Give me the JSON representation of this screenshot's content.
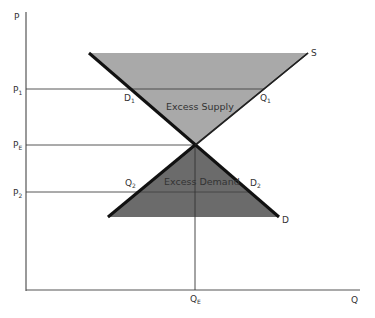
{
  "axes": {
    "y_label": "P",
    "x_label": "Q"
  },
  "price_levels": [
    {
      "id": "p1",
      "label": "P",
      "subscript": "1"
    },
    {
      "id": "pe",
      "label": "P",
      "subscript": "E"
    },
    {
      "id": "p2",
      "label": "P",
      "subscript": "2"
    }
  ],
  "quantity_marks": [
    {
      "id": "qe",
      "label": "Q",
      "subscript": "E"
    }
  ],
  "curves": {
    "supply": {
      "label": "S"
    },
    "demand": {
      "label": "D"
    }
  },
  "points": {
    "d1": {
      "label": "D",
      "subscript": "1"
    },
    "q1": {
      "label": "Q",
      "subscript": "1"
    },
    "q2": {
      "label": "Q",
      "subscript": "2"
    },
    "d2": {
      "label": "D",
      "subscript": "2"
    }
  },
  "regions": {
    "excess_supply": {
      "label": "Excess Supply",
      "color": "#a9a9a9"
    },
    "excess_demand": {
      "label": "Excess Demand",
      "color": "#6b6b6b"
    }
  },
  "colors": {
    "axis": "#555555",
    "guide_line": "#444444",
    "demand_curve": "#111111",
    "supply_curve": "#222222"
  }
}
